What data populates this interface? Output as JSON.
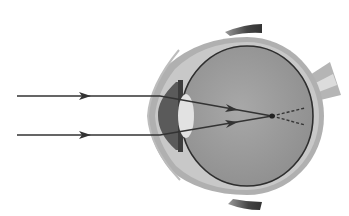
{
  "diagram": {
    "colors": {
      "background": "#ffffff",
      "sclera": "#a9a9a9",
      "sclera_light": "#c9c9c9",
      "vitreous": "#9e9e9e",
      "choroid_line": "#2e2e2e",
      "lens": "#e2e2e2",
      "iris": "#555555",
      "eyelid": "#4a4a4a",
      "ray": "#333333",
      "optic_nerve": "#b5b5b5",
      "optic_nerve_light": "#dcdcdc"
    },
    "rays": [
      {
        "label": "upper-incident-ray",
        "y": 96
      },
      {
        "label": "lower-incident-ray",
        "y": 135
      }
    ],
    "focal_point": {
      "x": 272,
      "y": 116
    },
    "caption": ""
  }
}
